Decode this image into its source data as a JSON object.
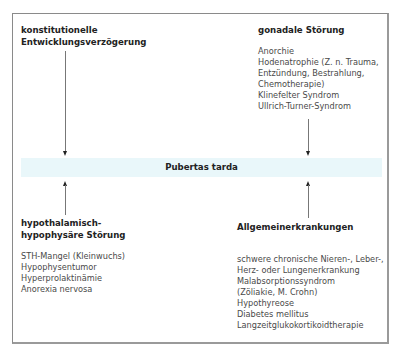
{
  "center": {
    "label": "Pubertas tarda",
    "band_color": "#e9f7fa"
  },
  "blocks": {
    "top_left": {
      "title_lines": [
        "konstitutionelle",
        "Entwicklungsverzögerung"
      ],
      "items": []
    },
    "top_right": {
      "title_lines": [
        "gonadale Störung"
      ],
      "items": [
        "Anorchie",
        "Hodenatrophie (Z. n. Trauma,",
        "Entzündung, Bestrahlung,",
        "Chemotherapie)",
        "Klinefelter Syndrom",
        "Ullrich-Turner-Syndrom"
      ]
    },
    "bottom_left": {
      "title_lines": [
        "hypothalamisch-",
        "hypophysäre Störung"
      ],
      "items": [
        "STH-Mangel (Kleinwuchs)",
        "Hypophysentumor",
        "Hyperprolaktinämie",
        "Anorexia nervosa"
      ]
    },
    "bottom_right": {
      "title_lines": [
        "Allgemeinerkrankungen"
      ],
      "items": [
        "schwere chronische Nieren-, Leber-,",
        "Herz- oder Lungenerkrankung",
        "Malabsorptionssyndrom",
        "(Zöliakie, M. Crohn)",
        "Hypothyreose",
        "Diabetes mellitus",
        "Langzeitglukokortikoidtherapie"
      ]
    }
  }
}
